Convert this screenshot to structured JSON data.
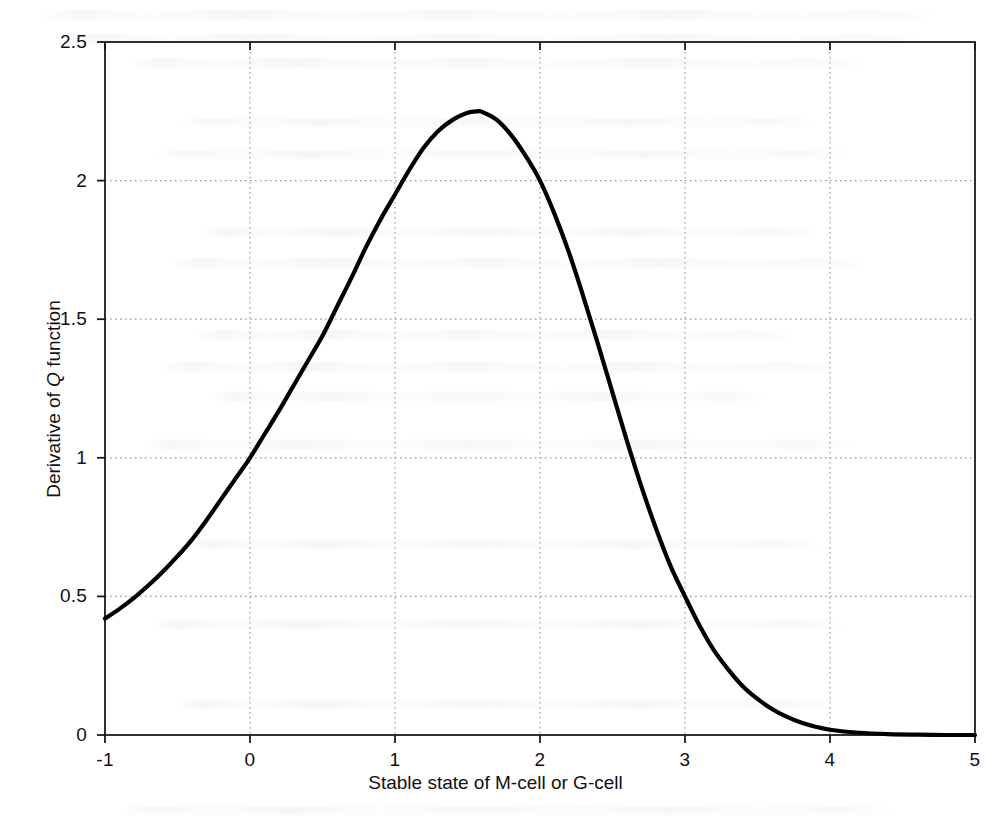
{
  "chart_data": {
    "type": "line",
    "title": "",
    "subtitle": "",
    "xlabel_prefix": "Stable state of M-cell or G-cell",
    "xlabel": "Stable state of M-cell or G-cell",
    "ylabel_prefix": "Derivative of ",
    "ylabel_symbol": "Q",
    "ylabel_suffix": " function",
    "ylabel": "Derivative of Q function",
    "xlim": [
      -1,
      5
    ],
    "ylim": [
      0,
      2.5
    ],
    "xticks": [
      "-1",
      "0",
      "1",
      "2",
      "3",
      "4",
      "5"
    ],
    "yticks": [
      "0",
      "0.5",
      "1",
      "1.5",
      "2",
      "2.5"
    ],
    "xtick_values": [
      -1,
      0,
      1,
      2,
      3,
      4,
      5
    ],
    "ytick_values": [
      0,
      0.5,
      1,
      1.5,
      2,
      2.5
    ],
    "grid": true,
    "grid_style": "dotted",
    "legend": null,
    "legend_position": "none",
    "line_color": "#000000",
    "line_width_px": 4,
    "peak": {
      "x": 1.57,
      "y": 2.25
    },
    "series": [
      {
        "name": "Derivative of Q function",
        "x": [
          -1.0,
          -0.9,
          -0.8,
          -0.7,
          -0.6,
          -0.5,
          -0.4,
          -0.3,
          -0.2,
          -0.1,
          0.0,
          0.1,
          0.2,
          0.3,
          0.4,
          0.5,
          0.6,
          0.7,
          0.8,
          0.9,
          1.0,
          1.1,
          1.2,
          1.3,
          1.4,
          1.5,
          1.57,
          1.6,
          1.7,
          1.8,
          1.9,
          2.0,
          2.1,
          2.2,
          2.3,
          2.4,
          2.5,
          2.6,
          2.7,
          2.8,
          2.9,
          3.0,
          3.1,
          3.2,
          3.3,
          3.4,
          3.5,
          3.6,
          3.7,
          3.8,
          3.9,
          4.0,
          4.2,
          4.4,
          4.6,
          4.8,
          5.0
        ],
        "y": [
          0.42,
          0.455,
          0.495,
          0.54,
          0.59,
          0.645,
          0.705,
          0.775,
          0.85,
          0.925,
          1.0,
          1.085,
          1.17,
          1.26,
          1.35,
          1.44,
          1.545,
          1.65,
          1.76,
          1.86,
          1.95,
          2.04,
          2.12,
          2.18,
          2.22,
          2.245,
          2.25,
          2.248,
          2.22,
          2.165,
          2.09,
          2.0,
          1.88,
          1.74,
          1.58,
          1.41,
          1.235,
          1.06,
          0.895,
          0.745,
          0.61,
          0.5,
          0.395,
          0.305,
          0.235,
          0.175,
          0.13,
          0.094,
          0.066,
          0.045,
          0.03,
          0.019,
          0.008,
          0.003,
          0.001,
          0.0,
          0.0
        ]
      }
    ]
  },
  "figure": {
    "background_color": "#ffffff",
    "axis_color": "#1a1a1a",
    "grid_color": "#9a9a9a"
  }
}
